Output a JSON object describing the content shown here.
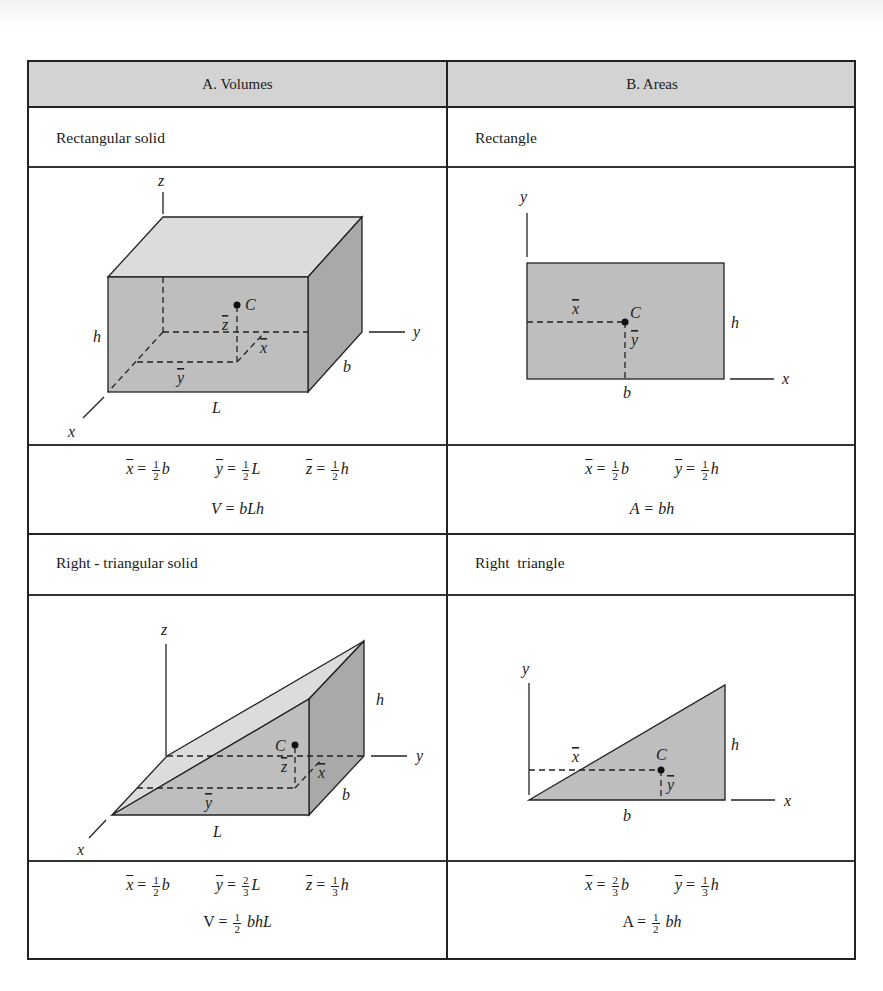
{
  "table": {
    "headers": {
      "volumes": "A. Volumes",
      "areas": "B. Areas"
    },
    "rows": [
      {
        "volume": {
          "name": "Rectangular solid",
          "diagram_labels": {
            "z_axis": "z",
            "y_axis": "y",
            "x_axis": "x",
            "centroid": "C",
            "h": "h",
            "b": "b",
            "L": "L",
            "zbar": "z",
            "xbar": "x",
            "ybar": "y"
          },
          "formulas": {
            "xbar": {
              "var": "x",
              "num": "1",
              "den": "2",
              "mult": "b"
            },
            "ybar": {
              "var": "y",
              "num": "1",
              "den": "2",
              "mult": "L"
            },
            "zbar": {
              "var": "z",
              "num": "1",
              "den": "2",
              "mult": "h"
            },
            "total": "V = bLh"
          }
        },
        "area": {
          "name": "Rectangle",
          "diagram_labels": {
            "y_axis": "y",
            "x_axis": "x",
            "centroid": "C",
            "h": "h",
            "b": "b",
            "xbar": "x",
            "ybar": "y"
          },
          "formulas": {
            "xbar": {
              "var": "x",
              "num": "1",
              "den": "2",
              "mult": "b"
            },
            "ybar": {
              "var": "y",
              "num": "1",
              "den": "2",
              "mult": "h"
            },
            "total": "A = bh"
          }
        }
      },
      {
        "volume": {
          "name": "Right - triangular solid",
          "diagram_labels": {
            "z_axis": "z",
            "y_axis": "y",
            "x_axis": "x",
            "centroid": "C",
            "h": "h",
            "b": "b",
            "L": "L",
            "zbar": "z",
            "xbar": "x",
            "ybar": "y"
          },
          "formulas": {
            "xbar": {
              "var": "x",
              "num": "1",
              "den": "2",
              "mult": "b"
            },
            "ybar": {
              "var": "y",
              "num": "2",
              "den": "3",
              "mult": "L"
            },
            "zbar": {
              "var": "z",
              "num": "1",
              "den": "3",
              "mult": "h"
            },
            "total_prefix": "V =",
            "total_num": "1",
            "total_den": "2",
            "total_suffix": "bhL"
          }
        },
        "area": {
          "name": "Right  triangle",
          "diagram_labels": {
            "y_axis": "y",
            "x_axis": "x",
            "centroid": "C",
            "h": "h",
            "b": "b",
            "xbar": "x",
            "ybar": "y"
          },
          "formulas": {
            "xbar": {
              "var": "x",
              "num": "2",
              "den": "3",
              "mult": "b"
            },
            "ybar": {
              "var": "y",
              "num": "1",
              "den": "3",
              "mult": "h"
            },
            "total_prefix": "A =",
            "total_num": "1",
            "total_den": "2",
            "total_suffix": "bh"
          }
        }
      }
    ]
  },
  "colors": {
    "header_fill": "#d3d3d3",
    "face_top": "#dcdcdc",
    "face_front": "#bebebe",
    "face_side": "#a9a9a9",
    "line": "#222222"
  }
}
